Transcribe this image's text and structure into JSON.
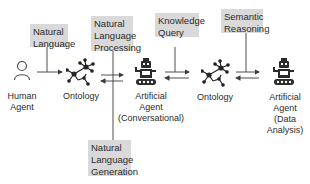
{
  "boxes": {
    "natural_language": "Natural Language",
    "nlp_line1": "Natural",
    "nlp_line2": "Language",
    "nlp_line3": "Processing",
    "knowledge_line1": "Knowledge",
    "knowledge_line2": "Query",
    "semantic_line1": "Semantic",
    "semantic_line2": "Reasoning",
    "nlg_line1": "Natural",
    "nlg_line2": "Language",
    "nlg_line3": "Generation",
    "nl_line1": "Natural",
    "nl_line2": "Language"
  },
  "nodes": {
    "human_line1": "Human",
    "human_line2": "Agent",
    "ontology1": "Ontology",
    "agent_conv_line1": "Artificial",
    "agent_conv_line2": "Agent",
    "agent_conv_line3": "(Conversational)",
    "ontology2": "Ontology",
    "agent_data_line1": "Artificial",
    "agent_data_line2": "Agent",
    "agent_data_line3": "(Data",
    "agent_data_line4": "Analysis)"
  },
  "colors": {
    "box_fill": "#d9d9d9",
    "line": "#3a3a3a",
    "text": "#2b2b2b"
  }
}
